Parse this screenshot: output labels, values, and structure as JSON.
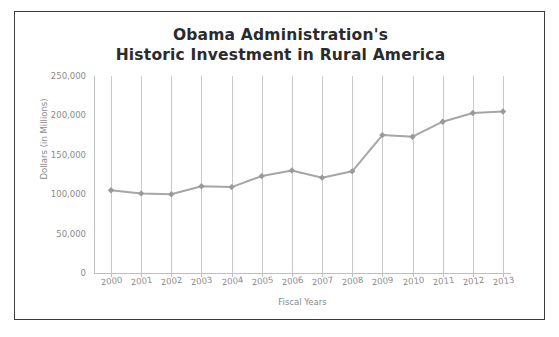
{
  "chart_data": {
    "type": "line",
    "title": "Obama Administration's Historic Investment in Rural America",
    "title_line1": "Obama Administration's",
    "title_line2": "Historic Investment in Rural America",
    "xlabel": "Fiscal Years",
    "ylabel": "Dollars (in Millions)",
    "categories": [
      "2000",
      "2001",
      "2002",
      "2003",
      "2004",
      "2005",
      "2006",
      "2007",
      "2008",
      "2009",
      "2010",
      "2011",
      "2012",
      "2013"
    ],
    "values": [
      105000,
      101000,
      100000,
      110000,
      109000,
      123000,
      130000,
      121000,
      129000,
      175000,
      173000,
      192000,
      203000,
      205000
    ],
    "ylim": [
      0,
      250000
    ],
    "yticks": [
      0,
      50000,
      100000,
      150000,
      200000,
      250000
    ],
    "ytick_labels": [
      "0",
      "50,000",
      "100,000",
      "150,000",
      "200,000",
      "250,000"
    ],
    "grid": "vertical",
    "legend": "none",
    "series": [
      {
        "name": "Investment",
        "color": "#a6a6a6",
        "marker": "diamond",
        "values": [
          105000,
          101000,
          100000,
          110000,
          109000,
          123000,
          130000,
          121000,
          129000,
          175000,
          173000,
          192000,
          203000,
          205000
        ]
      }
    ]
  },
  "colors": {
    "line": "#a6a6a6",
    "marker": "#9a9a9a",
    "grid": "#c9c9c9",
    "axis": "#bfbfbf",
    "tick_text": "#8a8a8a",
    "title_text": "#2b2b2b",
    "frame_border": "#3c3c3c",
    "background": "#ffffff"
  }
}
